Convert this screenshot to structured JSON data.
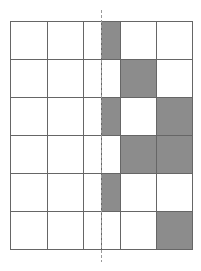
{
  "diagram": {
    "type": "grid-with-shaded-cells",
    "rows": 6,
    "columns": 6,
    "column_edges_px": [
      10,
      47,
      83,
      101,
      120,
      156,
      192
    ],
    "row_edges_px": [
      21,
      59,
      97,
      135,
      173,
      211,
      249
    ],
    "shaded_cells": [
      {
        "row": 0,
        "col": 3
      },
      {
        "row": 1,
        "col": 4
      },
      {
        "row": 2,
        "col": 3
      },
      {
        "row": 2,
        "col": 5
      },
      {
        "row": 3,
        "col": 4
      },
      {
        "row": 3,
        "col": 5
      },
      {
        "row": 4,
        "col": 3
      },
      {
        "row": 5,
        "col": 5
      }
    ],
    "dashed_line": {
      "x": 101,
      "y1": 10,
      "y2": 262
    },
    "colors": {
      "shade": "#8c8c8c",
      "grid_line": "#666666",
      "dashed_line": "#999999",
      "background": "#ffffff"
    }
  }
}
